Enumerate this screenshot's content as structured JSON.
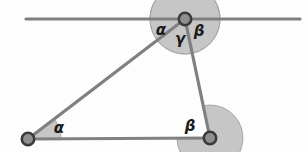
{
  "figure": {
    "type": "geometry-diagram",
    "canvas": {
      "width": 308,
      "height": 152,
      "background": "#fdfdfd"
    },
    "colors": {
      "stroke": "#7f8083",
      "wedge_fill": "#c6c6c6",
      "wedge_stroke": "#9a9a9a",
      "vertex_ring": "#3a3a3a",
      "vertex_core": "#8f8f8f",
      "label_text": "#1a1a1a"
    },
    "points": {
      "apex": {
        "name": "C",
        "x": 185,
        "y": 19
      },
      "bottom_left": {
        "name": "A",
        "x": 28,
        "y": 139
      },
      "bottom_right": {
        "name": "B",
        "x": 210,
        "y": 138
      }
    },
    "parallel_line": {
      "name": "line-through-apex",
      "x1": 26,
      "y1": 19,
      "x2": 300,
      "y2": 19
    },
    "segments": [
      {
        "name": "side-a-to-c",
        "from": "bottom_left",
        "to": "apex"
      },
      {
        "name": "side-c-to-b",
        "from": "apex",
        "to": "bottom_right"
      },
      {
        "name": "side-a-to-b",
        "from": "bottom_left",
        "to": "bottom_right"
      }
    ],
    "angles": [
      {
        "name": "alpha-at-apex",
        "symbol": "α",
        "vertex": "apex",
        "label_x": 161,
        "label_y": 35,
        "radius": 35
      },
      {
        "name": "gamma-at-apex",
        "symbol": "γ",
        "vertex": "apex",
        "label_x": 180,
        "label_y": 44,
        "radius": 35
      },
      {
        "name": "beta-at-apex",
        "symbol": "β",
        "vertex": "apex",
        "label_x": 199,
        "label_y": 36,
        "radius": 35
      },
      {
        "name": "alpha-at-bottom-left",
        "symbol": "α",
        "vertex": "bottom_left",
        "label_x": 59,
        "label_y": 133,
        "radius": 33
      },
      {
        "name": "beta-at-bottom-right",
        "symbol": "β",
        "vertex": "bottom_right",
        "label_x": 190,
        "label_y": 131,
        "radius": 33
      }
    ]
  }
}
